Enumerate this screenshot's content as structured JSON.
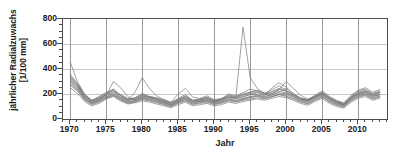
{
  "chart_data": {
    "type": "line",
    "title": "",
    "xlabel": "Jahr",
    "ylabel": "jährlicher Radialzuwachs",
    "ylabel_line2": "[1/100 mm]",
    "xlim": [
      1969,
      2014
    ],
    "ylim": [
      0,
      800
    ],
    "yticks": [
      0,
      200,
      400,
      600,
      800
    ],
    "ytick_labels": [
      "0",
      "200",
      "400",
      "600",
      "800"
    ],
    "xticks": [
      1970,
      1975,
      1980,
      1985,
      1990,
      1995,
      2000,
      2005,
      2010
    ],
    "xtick_labels": [
      "1970",
      "1975",
      "1980",
      "1985",
      "1990",
      "1995",
      "2000",
      "2005",
      "2010"
    ],
    "x_minor_step": 1,
    "y_minor_step": 50,
    "grid": {
      "horizontal": true,
      "vertical": true,
      "color": "#c8c8c8"
    },
    "legend": null,
    "line_color": "#7a7a7a",
    "line_width": 0.7,
    "x": [
      1970,
      1971,
      1972,
      1973,
      1974,
      1975,
      1976,
      1977,
      1978,
      1979,
      1980,
      1981,
      1982,
      1983,
      1984,
      1985,
      1986,
      1987,
      1988,
      1989,
      1990,
      1991,
      1992,
      1993,
      1994,
      1995,
      1996,
      1997,
      1998,
      1999,
      2000,
      2001,
      2002,
      2003,
      2004,
      2005,
      2006,
      2007,
      2008,
      2009,
      2010,
      2011,
      2012,
      2013
    ],
    "series": [
      {
        "name": "tree-01",
        "values": [
          455,
          300,
          200,
          150,
          175,
          205,
          240,
          185,
          150,
          170,
          205,
          180,
          170,
          155,
          130,
          165,
          195,
          150,
          160,
          175,
          150,
          160,
          200,
          185,
          210,
          240,
          225,
          210,
          195,
          215,
          245,
          205,
          165,
          150,
          185,
          215,
          175,
          145,
          130,
          190,
          230,
          250,
          215,
          235
        ]
      },
      {
        "name": "tree-02",
        "values": [
          320,
          265,
          180,
          145,
          160,
          190,
          210,
          170,
          145,
          160,
          185,
          175,
          160,
          140,
          120,
          150,
          175,
          145,
          150,
          165,
          140,
          155,
          175,
          170,
          735,
          330,
          245,
          200,
          180,
          195,
          210,
          185,
          150,
          140,
          170,
          195,
          160,
          135,
          120,
          175,
          210,
          225,
          195,
          215
        ]
      },
      {
        "name": "tree-03",
        "values": [
          330,
          270,
          175,
          135,
          155,
          185,
          300,
          250,
          180,
          150,
          175,
          165,
          150,
          135,
          115,
          145,
          170,
          140,
          145,
          155,
          135,
          145,
          165,
          160,
          175,
          195,
          210,
          185,
          250,
          290,
          255,
          200,
          165,
          150,
          175,
          200,
          155,
          130,
          115,
          165,
          200,
          215,
          185,
          200
        ]
      },
      {
        "name": "tree-04",
        "values": [
          300,
          250,
          165,
          130,
          150,
          180,
          200,
          165,
          140,
          150,
          170,
          160,
          145,
          130,
          110,
          140,
          160,
          130,
          140,
          150,
          130,
          140,
          160,
          150,
          165,
          180,
          190,
          175,
          200,
          235,
          300,
          245,
          190,
          160,
          180,
          210,
          165,
          135,
          110,
          160,
          195,
          210,
          180,
          195
        ]
      },
      {
        "name": "tree-05",
        "values": [
          345,
          275,
          185,
          140,
          165,
          195,
          215,
          175,
          150,
          215,
          330,
          245,
          185,
          155,
          135,
          200,
          245,
          175,
          165,
          185,
          155,
          165,
          190,
          180,
          200,
          215,
          230,
          205,
          235,
          265,
          230,
          195,
          170,
          155,
          190,
          225,
          180,
          150,
          125,
          180,
          225,
          240,
          205,
          225
        ]
      },
      {
        "name": "tree-06",
        "values": [
          290,
          240,
          160,
          125,
          145,
          175,
          195,
          160,
          135,
          145,
          165,
          155,
          140,
          125,
          105,
          135,
          155,
          125,
          135,
          145,
          125,
          135,
          155,
          145,
          160,
          175,
          185,
          170,
          190,
          210,
          195,
          175,
          145,
          130,
          160,
          185,
          145,
          120,
          105,
          155,
          185,
          200,
          170,
          185
        ]
      },
      {
        "name": "tree-07",
        "values": [
          310,
          255,
          170,
          130,
          150,
          200,
          230,
          195,
          165,
          155,
          180,
          170,
          155,
          135,
          115,
          145,
          165,
          135,
          145,
          155,
          135,
          150,
          175,
          165,
          180,
          200,
          195,
          180,
          205,
          225,
          205,
          180,
          155,
          140,
          170,
          195,
          155,
          125,
          110,
          165,
          195,
          210,
          180,
          195
        ]
      },
      {
        "name": "tree-08",
        "values": [
          270,
          225,
          150,
          115,
          135,
          165,
          185,
          150,
          125,
          135,
          155,
          145,
          130,
          115,
          100,
          125,
          145,
          115,
          125,
          135,
          115,
          125,
          145,
          135,
          150,
          160,
          170,
          160,
          175,
          195,
          180,
          160,
          135,
          120,
          150,
          175,
          135,
          110,
          95,
          145,
          175,
          190,
          160,
          175
        ]
      },
      {
        "name": "tree-09",
        "values": [
          335,
          280,
          190,
          150,
          170,
          200,
          225,
          185,
          160,
          170,
          195,
          180,
          165,
          150,
          130,
          160,
          185,
          150,
          155,
          170,
          145,
          160,
          185,
          175,
          195,
          215,
          225,
          200,
          220,
          245,
          225,
          195,
          165,
          150,
          180,
          210,
          170,
          140,
          120,
          175,
          215,
          230,
          200,
          215
        ]
      },
      {
        "name": "tree-10",
        "values": [
          250,
          205,
          140,
          105,
          125,
          160,
          180,
          145,
          120,
          130,
          145,
          135,
          120,
          105,
          90,
          115,
          135,
          105,
          115,
          125,
          105,
          115,
          135,
          125,
          140,
          150,
          160,
          150,
          165,
          180,
          170,
          150,
          125,
          110,
          140,
          165,
          125,
          100,
          88,
          135,
          165,
          180,
          150,
          165
        ]
      },
      {
        "name": "tree-11",
        "values": [
          360,
          285,
          195,
          145,
          180,
          215,
          235,
          190,
          155,
          165,
          190,
          175,
          160,
          145,
          125,
          155,
          180,
          145,
          155,
          170,
          145,
          155,
          180,
          170,
          190,
          205,
          215,
          195,
          215,
          240,
          220,
          190,
          160,
          145,
          175,
          205,
          165,
          135,
          115,
          170,
          205,
          220,
          190,
          210
        ]
      },
      {
        "name": "tree-12",
        "values": [
          280,
          230,
          155,
          120,
          140,
          170,
          190,
          155,
          130,
          140,
          160,
          150,
          135,
          120,
          100,
          130,
          150,
          120,
          130,
          140,
          120,
          130,
          150,
          140,
          155,
          170,
          180,
          165,
          180,
          200,
          185,
          165,
          140,
          125,
          155,
          180,
          140,
          115,
          100,
          150,
          180,
          195,
          165,
          180
        ]
      }
    ]
  }
}
